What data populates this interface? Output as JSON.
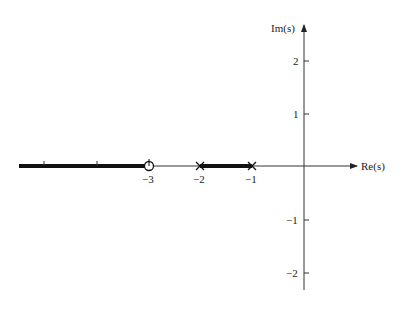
{
  "diagram": {
    "type": "root-locus",
    "axes": {
      "x_label": "Re(s)",
      "y_label": "Im(s)",
      "x_ticks": [
        {
          "value": -5,
          "label": ""
        },
        {
          "value": -4,
          "label": ""
        },
        {
          "value": -3,
          "label": "−3"
        },
        {
          "value": -2,
          "label": "−2"
        },
        {
          "value": -1,
          "label": "−1"
        }
      ],
      "y_ticks": [
        {
          "value": 2,
          "label": "2"
        },
        {
          "value": 1,
          "label": "1"
        },
        {
          "value": -1,
          "label": "−1"
        },
        {
          "value": -2,
          "label": "−2"
        }
      ]
    },
    "poles": [
      {
        "re": -2,
        "im": 0,
        "marker": "x"
      },
      {
        "re": -1,
        "im": 0,
        "marker": "x"
      }
    ],
    "zeros": [
      {
        "re": -3,
        "im": 0,
        "marker": "o"
      }
    ],
    "locus_segments": [
      {
        "from": -5.5,
        "to": -3,
        "label": "left of zero to -infinity"
      },
      {
        "from": -2,
        "to": -1,
        "label": "between poles"
      }
    ],
    "colors": {
      "axis": "#333333",
      "locus": "#111111",
      "text": "#222222"
    }
  }
}
